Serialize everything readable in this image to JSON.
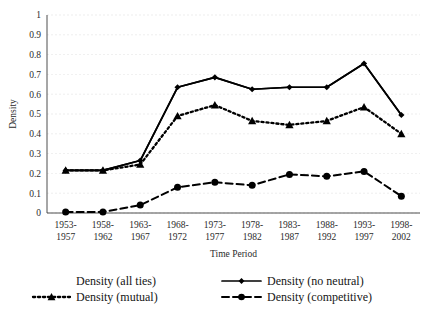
{
  "chart_data": {
    "type": "line",
    "title": "",
    "xlabel": "Time Period",
    "ylabel": "Density",
    "ylim": [
      0,
      1
    ],
    "ytick_step": 0.1,
    "yticks": [
      "0",
      "0.1",
      "0.2",
      "0.3",
      "0.4",
      "0.5",
      "0.6",
      "0.7",
      "0.8",
      "0.9",
      "1"
    ],
    "grid": true,
    "legend_position": "bottom",
    "categories": [
      "1953-\n1957",
      "1958-\n1962",
      "1963-\n1967",
      "1968-\n1972",
      "1973-\n1977",
      "1978-\n1982",
      "1983-\n1987",
      "1988-\n1992",
      "1993-\n1997",
      "1998-\n2002"
    ],
    "categories_line1": [
      "1953-",
      "1958-",
      "1963-",
      "1968-",
      "1973-",
      "1978-",
      "1983-",
      "1988-",
      "1993-",
      "1998-"
    ],
    "categories_line2": [
      "1957",
      "1962",
      "1967",
      "1972",
      "1977",
      "1982",
      "1987",
      "1992",
      "1997",
      "2002"
    ],
    "series": [
      {
        "name": "Density (all ties)",
        "style": "solid",
        "marker": "none",
        "color": "#000000",
        "values": [
          0.215,
          0.215,
          0.265,
          0.635,
          0.685,
          0.625,
          0.635,
          0.635,
          0.755,
          0.495
        ]
      },
      {
        "name": "Density (no neutral)",
        "style": "solid",
        "marker": "diamond",
        "color": "#000000",
        "values": [
          0.215,
          0.215,
          0.265,
          0.635,
          0.685,
          0.625,
          0.635,
          0.635,
          0.755,
          0.495
        ]
      },
      {
        "name": "Density (mutual)",
        "style": "dotted",
        "marker": "triangle",
        "color": "#000000",
        "values": [
          0.215,
          0.215,
          0.245,
          0.49,
          0.545,
          0.465,
          0.445,
          0.465,
          0.535,
          0.4
        ]
      },
      {
        "name": "Density (competitive)",
        "style": "dashed",
        "marker": "circle",
        "color": "#000000",
        "values": [
          0.005,
          0.005,
          0.04,
          0.13,
          0.155,
          0.14,
          0.195,
          0.185,
          0.21,
          0.085
        ]
      }
    ]
  },
  "legend": {
    "entries": [
      {
        "label": "Density (all ties)",
        "style": "none",
        "marker": "none"
      },
      {
        "label": "Density (no neutral)",
        "style": "solid",
        "marker": "diamond"
      },
      {
        "label": "Density (mutual)",
        "style": "dotted",
        "marker": "triangle"
      },
      {
        "label": "Density (competitive)",
        "style": "dashed",
        "marker": "circle"
      }
    ]
  }
}
